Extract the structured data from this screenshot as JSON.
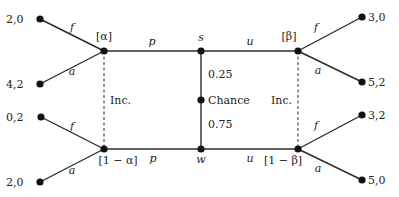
{
  "colors": {
    "line": "#2b2b2b",
    "node": "#111111",
    "text": "#222222",
    "background": "#ffffff"
  },
  "nodes": {
    "alpha": {
      "x": 104,
      "y": 51,
      "label": "[α]",
      "lx": 104,
      "ly": 40
    },
    "oneMinusAlpha": {
      "x": 104,
      "y": 149,
      "label": "[1 − α]",
      "lx": 118,
      "ly": 164
    },
    "s": {
      "x": 201,
      "y": 51,
      "label": "s",
      "lx": 201,
      "ly": 41
    },
    "w": {
      "x": 201,
      "y": 149,
      "label": "w",
      "lx": 201,
      "ly": 163
    },
    "chance": {
      "x": 201,
      "y": 100,
      "label": "Chance",
      "lx": 208,
      "ly": 104
    },
    "beta": {
      "x": 298,
      "y": 51,
      "label": "[β]",
      "lx": 289,
      "ly": 40
    },
    "oneMinusBeta": {
      "x": 298,
      "y": 149,
      "label": "[1 − β]",
      "lx": 283,
      "ly": 164
    }
  },
  "terminals": [
    {
      "x": 40,
      "y": 19,
      "payoff": "2,0",
      "from": "alpha",
      "action": "f",
      "ax": 72,
      "ay": 31,
      "px": 6,
      "py": 23
    },
    {
      "x": 40,
      "y": 84,
      "payoff": "4,2",
      "from": "alpha",
      "action": "a",
      "ax": 72,
      "ay": 75,
      "px": 6,
      "py": 88
    },
    {
      "x": 41,
      "y": 117,
      "payoff": "0,2",
      "from": "oneMinusAlpha",
      "action": "f",
      "ax": 72,
      "ay": 130,
      "px": 6,
      "py": 121
    },
    {
      "x": 40,
      "y": 182,
      "payoff": "2,0",
      "from": "oneMinusAlpha",
      "action": "a",
      "ax": 72,
      "ay": 174,
      "px": 6,
      "py": 186
    },
    {
      "x": 362,
      "y": 17,
      "payoff": "3,0",
      "from": "beta",
      "action": "f",
      "ax": 316,
      "ay": 31,
      "px": 368,
      "py": 21
    },
    {
      "x": 362,
      "y": 82,
      "payoff": "5,2",
      "from": "beta",
      "action": "a",
      "ax": 318,
      "ay": 74,
      "px": 368,
      "py": 86
    },
    {
      "x": 362,
      "y": 115,
      "payoff": "3,2",
      "from": "oneMinusBeta",
      "action": "f",
      "ax": 316,
      "ay": 129,
      "px": 368,
      "py": 119
    },
    {
      "x": 362,
      "y": 180,
      "payoff": "5,0",
      "from": "oneMinusBeta",
      "action": "a",
      "ax": 318,
      "ay": 172,
      "px": 368,
      "py": 184
    }
  ],
  "edges": {
    "top_p": {
      "label": "p",
      "lx": 152,
      "ly": 45
    },
    "top_u": {
      "label": "u",
      "lx": 250,
      "ly": 45
    },
    "bottom_p": {
      "label": "p",
      "lx": 153,
      "ly": 162
    },
    "bottom_u": {
      "label": "u",
      "lx": 250,
      "ly": 162
    }
  },
  "chance_probs": {
    "upper": {
      "label": "0.25",
      "lx": 208,
      "ly": 78
    },
    "lower": {
      "label": "0.75",
      "lx": 208,
      "ly": 128
    }
  },
  "info_sets": {
    "left": {
      "label": "Inc.",
      "lx": 110,
      "ly": 104
    },
    "right": {
      "label": "Inc.",
      "lx": 271,
      "ly": 104
    }
  }
}
